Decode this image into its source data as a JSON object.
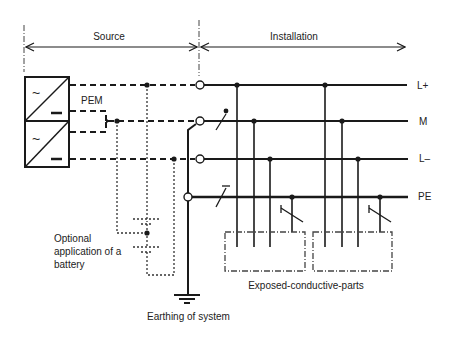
{
  "diagram": {
    "sections": {
      "source": "Source",
      "installation": "Installation"
    },
    "converter_label": "PEM",
    "converters": [
      {
        "ac_symbol": "~",
        "dc_symbol": "–"
      },
      {
        "ac_symbol": "~",
        "dc_symbol": "–"
      }
    ],
    "conductors": [
      {
        "id": "lplus",
        "label": "L+"
      },
      {
        "id": "m",
        "label": "M"
      },
      {
        "id": "lminus",
        "label": "L–"
      },
      {
        "id": "pe",
        "label": "PE"
      }
    ],
    "battery_note": [
      "Optional",
      "application of a",
      "battery"
    ],
    "earthing_label": "Earthing of system",
    "exposed_parts_label": "Exposed-conductive-parts",
    "colors": {
      "line": "#1a1a1a",
      "text": "#222222",
      "background": "#ffffff"
    }
  }
}
